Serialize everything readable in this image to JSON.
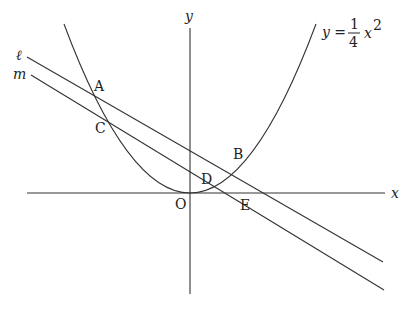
{
  "diagram": {
    "type": "coordinate-geometry",
    "axes": {
      "x_label": "x",
      "y_label": "y",
      "origin_label": "O"
    },
    "curve": {
      "name": "parabola",
      "equation_lhs": "y =",
      "coef_num": "1",
      "coef_den": "4",
      "var": "x",
      "exp": "2"
    },
    "lines": [
      {
        "label": "ℓ",
        "name": "line-l"
      },
      {
        "label": "m",
        "name": "line-m"
      }
    ],
    "points": {
      "A": "A",
      "B": "B",
      "C": "C",
      "D": "D",
      "E": "E"
    },
    "colors": {
      "stroke": "#333333",
      "background": "#ffffff"
    }
  }
}
